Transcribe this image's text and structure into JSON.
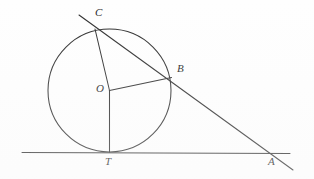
{
  "figure": {
    "kind": "geometry-diagram",
    "background_color": "#fefefe",
    "stroke_color": "#2b2b2b",
    "label_color": "#232323",
    "width": 314,
    "height": 179
  },
  "geometry": {
    "circle": {
      "name": "circle-o",
      "cx": 109.5,
      "cy": 90.5,
      "r": 61.5
    },
    "points": [
      {
        "id": "C",
        "label": "C",
        "x": 95,
        "y": 29,
        "label_x": 95,
        "label_y": 7,
        "on": "circle"
      },
      {
        "id": "B",
        "label": "B",
        "x": 171.5,
        "y": 77.5,
        "label_x": 177,
        "label_y": 63,
        "on": "circle"
      },
      {
        "id": "O",
        "label": "O",
        "x": 109.5,
        "y": 90.5,
        "label_x": 96,
        "label_y": 83,
        "on": "center"
      },
      {
        "id": "T",
        "label": "T",
        "x": 109.5,
        "y": 152,
        "label_x": 105,
        "label_y": 156,
        "on": "circle-tangent-point"
      },
      {
        "id": "A",
        "label": "A",
        "x": 275,
        "y": 153,
        "label_x": 268,
        "label_y": 156,
        "on": "tangent-line"
      }
    ],
    "segments": [
      {
        "name": "tangent-line-TA",
        "x1": 22,
        "y1": 152.5,
        "x2": 290,
        "y2": 153.5
      },
      {
        "name": "secant-line-CBA",
        "x1": 79,
        "y1": 15,
        "x2": 293,
        "y2": 170
      },
      {
        "name": "radius-OC",
        "x1": 109.5,
        "y1": 90.5,
        "x2": 95,
        "y2": 29
      },
      {
        "name": "radius-OB",
        "x1": 109.5,
        "y1": 90.5,
        "x2": 171.5,
        "y2": 77.5
      },
      {
        "name": "radius-OT",
        "x1": 109.5,
        "y1": 90.5,
        "x2": 109.5,
        "y2": 152
      }
    ]
  }
}
